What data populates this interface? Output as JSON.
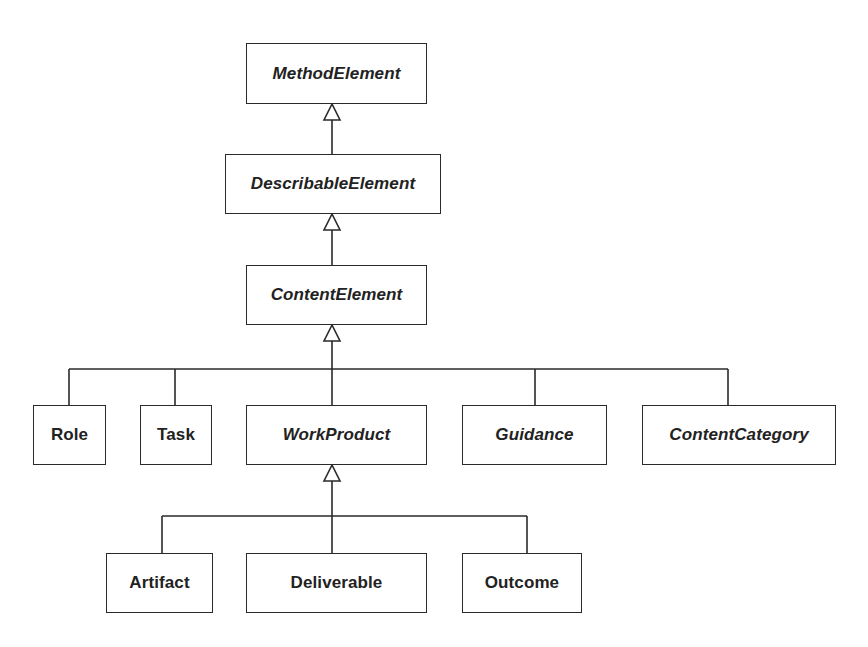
{
  "diagram": {
    "type": "uml-class-inheritance",
    "classes": [
      {
        "id": "method_element",
        "name": "MethodElement",
        "abstract": true
      },
      {
        "id": "describable_element",
        "name": "DescribableElement",
        "abstract": true
      },
      {
        "id": "content_element",
        "name": "ContentElement",
        "abstract": true
      },
      {
        "id": "role",
        "name": "Role",
        "abstract": false
      },
      {
        "id": "task",
        "name": "Task",
        "abstract": false
      },
      {
        "id": "work_product",
        "name": "WorkProduct",
        "abstract": true
      },
      {
        "id": "guidance",
        "name": "Guidance",
        "abstract": true
      },
      {
        "id": "content_category",
        "name": "ContentCategory",
        "abstract": true
      },
      {
        "id": "artifact",
        "name": "Artifact",
        "abstract": false
      },
      {
        "id": "deliverable",
        "name": "Deliverable",
        "abstract": false
      },
      {
        "id": "outcome",
        "name": "Outcome",
        "abstract": false
      }
    ],
    "generalizations": [
      {
        "child": "DescribableElement",
        "parent": "MethodElement"
      },
      {
        "child": "ContentElement",
        "parent": "DescribableElement"
      },
      {
        "child": "Role",
        "parent": "ContentElement"
      },
      {
        "child": "Task",
        "parent": "ContentElement"
      },
      {
        "child": "WorkProduct",
        "parent": "ContentElement"
      },
      {
        "child": "Guidance",
        "parent": "ContentElement"
      },
      {
        "child": "ContentCategory",
        "parent": "ContentElement"
      },
      {
        "child": "Artifact",
        "parent": "WorkProduct"
      },
      {
        "child": "Deliverable",
        "parent": "WorkProduct"
      },
      {
        "child": "Outcome",
        "parent": "WorkProduct"
      }
    ],
    "colors": {
      "line": "#2a2a2a",
      "text": "#222222",
      "background": "#ffffff"
    }
  }
}
